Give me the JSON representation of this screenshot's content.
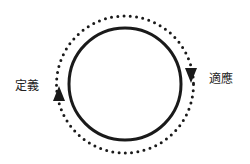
{
  "diagram": {
    "type": "cycle",
    "labels": {
      "left": "定義",
      "right": "適應"
    },
    "colors": {
      "stroke": "#1a1a1a",
      "background": "#ffffff"
    },
    "direction": "clockwise",
    "arrows": [
      {
        "position": "left",
        "points": "up"
      },
      {
        "position": "right",
        "points": "down"
      }
    ]
  }
}
